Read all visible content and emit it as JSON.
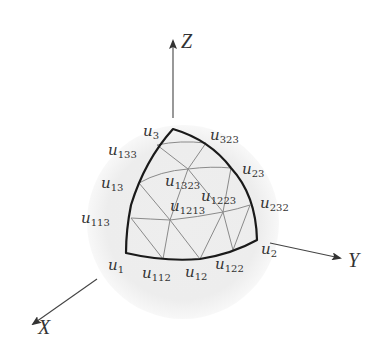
{
  "diagram": {
    "type": "spherical-triangle-subdivision",
    "colors": {
      "background": "#ffffff",
      "disk": "#ececec",
      "edge": "#1a1a1a",
      "grid": "#8a8a8a",
      "axis": "#444444",
      "text": "#333333"
    },
    "axes": [
      {
        "id": "Z",
        "label": "Z",
        "from": [
          173,
          118
        ],
        "to": [
          173,
          42
        ],
        "label_pos": [
          182,
          46
        ]
      },
      {
        "id": "Y",
        "label": "Y",
        "from": [
          270,
          243
        ],
        "to": [
          340,
          258
        ],
        "label_pos": [
          348,
          266
        ]
      },
      {
        "id": "X",
        "label": "X",
        "from": [
          97,
          279
        ],
        "to": [
          33,
          324
        ],
        "label_pos": [
          38,
          334
        ]
      }
    ],
    "disk": {
      "cx": 183,
      "cy": 222,
      "rx": 96,
      "ry": 97
    },
    "vertices": [
      {
        "name": "u",
        "sub": "3",
        "pt": [
          173,
          129
        ],
        "label_pos": [
          143,
          134
        ]
      },
      {
        "name": "u",
        "sub": "323",
        "pt": [
          206,
          143
        ],
        "label_pos": [
          210,
          138
        ]
      },
      {
        "name": "u",
        "sub": "133",
        "pt": [
          157,
          145
        ],
        "label_pos": [
          108,
          153
        ]
      },
      {
        "name": "u",
        "sub": "23",
        "pt": [
          231,
          168
        ],
        "label_pos": [
          242,
          174
        ]
      },
      {
        "name": "u",
        "sub": "13",
        "pt": [
          139,
          183
        ],
        "label_pos": [
          101,
          187
        ]
      },
      {
        "name": "u",
        "sub": "1323",
        "pt": [
          188,
          169
        ],
        "label_pos": [
          165,
          187
        ]
      },
      {
        "name": "u",
        "sub": "1223",
        "pt": [
          223,
          212
        ],
        "label_pos": [
          201,
          201
        ]
      },
      {
        "name": "u",
        "sub": "232",
        "pt": [
          250,
          205
        ],
        "label_pos": [
          260,
          210
        ]
      },
      {
        "name": "u",
        "sub": "1213",
        "pt": [
          170,
          220
        ],
        "label_pos": [
          170,
          212
        ]
      },
      {
        "name": "u",
        "sub": "113",
        "pt": [
          131,
          218
        ],
        "label_pos": [
          81,
          225
        ]
      },
      {
        "name": "u",
        "sub": "1",
        "pt": [
          126,
          253
        ],
        "label_pos": [
          108,
          272
        ]
      },
      {
        "name": "u",
        "sub": "112",
        "pt": [
          163,
          259
        ],
        "label_pos": [
          142,
          280
        ]
      },
      {
        "name": "u",
        "sub": "12",
        "pt": [
          200,
          259
        ],
        "label_pos": [
          185,
          279
        ]
      },
      {
        "name": "u",
        "sub": "122",
        "pt": [
          233,
          250
        ],
        "label_pos": [
          215,
          271
        ]
      },
      {
        "name": "u",
        "sub": "2",
        "pt": [
          257,
          240
        ],
        "label_pos": [
          261,
          256
        ]
      }
    ],
    "labels_text": [
      "u3",
      "u323",
      "u133",
      "u23",
      "u13",
      "u1323",
      "u1223",
      "u232",
      "u1213",
      "u113",
      "u1",
      "u112",
      "u12",
      "u122",
      "u2",
      "X",
      "Y",
      "Z"
    ]
  }
}
